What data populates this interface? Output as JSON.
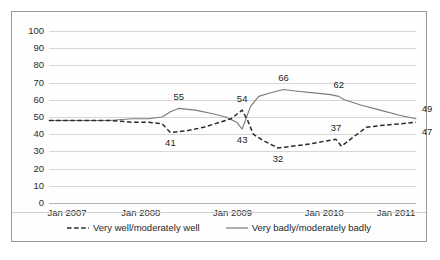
{
  "chart_data": {
    "type": "line",
    "title": "",
    "xlabel": "",
    "ylabel": "",
    "ylim": [
      0,
      100
    ],
    "ytick_step": 10,
    "yticks": [
      100,
      90,
      80,
      70,
      60,
      50,
      40,
      30,
      20,
      10,
      0
    ],
    "xticks": [
      "Jan 2007",
      "Jan 2008",
      "Jan 2009",
      "Jan 2010",
      "Jan 2011"
    ],
    "grid": "horizontal",
    "legend_position": "bottom",
    "series": [
      {
        "name": "Very well/moderately well",
        "style": "dashed",
        "color": "#2b2b2b",
        "points": [
          {
            "x": 0.0,
            "y": 48
          },
          {
            "x": 0.07,
            "y": 48
          },
          {
            "x": 0.14,
            "y": 48
          },
          {
            "x": 0.22,
            "y": 48
          },
          {
            "x": 0.3,
            "y": 47
          },
          {
            "x": 0.36,
            "y": 47
          },
          {
            "x": 0.41,
            "y": 46
          },
          {
            "x": 0.44,
            "y": 41
          },
          {
            "x": 0.5,
            "y": 42
          },
          {
            "x": 0.56,
            "y": 44
          },
          {
            "x": 0.62,
            "y": 47
          },
          {
            "x": 0.66,
            "y": 49
          },
          {
            "x": 0.7,
            "y": 54
          },
          {
            "x": 0.72,
            "y": 48
          },
          {
            "x": 0.74,
            "y": 40
          },
          {
            "x": 0.78,
            "y": 36
          },
          {
            "x": 0.83,
            "y": 32
          },
          {
            "x": 0.88,
            "y": 33
          },
          {
            "x": 0.93,
            "y": 34
          },
          {
            "x": 0.97,
            "y": 35
          },
          {
            "x": 1.0,
            "y": 36
          },
          {
            "x": 1.04,
            "y": 37
          },
          {
            "x": 1.06,
            "y": 33
          },
          {
            "x": 1.1,
            "y": 38
          },
          {
            "x": 1.15,
            "y": 44
          },
          {
            "x": 1.2,
            "y": 45
          },
          {
            "x": 1.27,
            "y": 46
          },
          {
            "x": 1.33,
            "y": 47
          }
        ],
        "labels": [
          {
            "value": 41,
            "at_x": 0.44,
            "position": "below"
          },
          {
            "value": 54,
            "at_x": 0.7,
            "position": "above"
          },
          {
            "value": 32,
            "at_x": 0.83,
            "position": "below"
          },
          {
            "value": 37,
            "at_x": 1.04,
            "position": "above"
          },
          {
            "value": 47,
            "at_x": 1.33,
            "position": "below-right"
          }
        ]
      },
      {
        "name": "Very badly/moderately badly",
        "style": "solid",
        "color": "#7a7a7a",
        "points": [
          {
            "x": 0.0,
            "y": 48
          },
          {
            "x": 0.07,
            "y": 48
          },
          {
            "x": 0.14,
            "y": 48
          },
          {
            "x": 0.22,
            "y": 48
          },
          {
            "x": 0.3,
            "y": 49
          },
          {
            "x": 0.36,
            "y": 49
          },
          {
            "x": 0.41,
            "y": 50
          },
          {
            "x": 0.44,
            "y": 53
          },
          {
            "x": 0.47,
            "y": 55
          },
          {
            "x": 0.53,
            "y": 54
          },
          {
            "x": 0.59,
            "y": 52
          },
          {
            "x": 0.64,
            "y": 50
          },
          {
            "x": 0.68,
            "y": 47
          },
          {
            "x": 0.7,
            "y": 43
          },
          {
            "x": 0.73,
            "y": 56
          },
          {
            "x": 0.76,
            "y": 62
          },
          {
            "x": 0.8,
            "y": 64
          },
          {
            "x": 0.85,
            "y": 66
          },
          {
            "x": 0.9,
            "y": 65
          },
          {
            "x": 0.96,
            "y": 64
          },
          {
            "x": 1.02,
            "y": 63
          },
          {
            "x": 1.05,
            "y": 62
          },
          {
            "x": 1.07,
            "y": 60
          },
          {
            "x": 1.13,
            "y": 57
          },
          {
            "x": 1.2,
            "y": 54
          },
          {
            "x": 1.27,
            "y": 51
          },
          {
            "x": 1.33,
            "y": 49
          }
        ],
        "labels": [
          {
            "value": 55,
            "at_x": 0.47,
            "position": "above"
          },
          {
            "value": 43,
            "at_x": 0.7,
            "position": "below"
          },
          {
            "value": 66,
            "at_x": 0.85,
            "position": "above"
          },
          {
            "value": 62,
            "at_x": 1.05,
            "position": "above"
          },
          {
            "value": 49,
            "at_x": 1.33,
            "position": "above-right"
          }
        ]
      }
    ]
  },
  "legend": {
    "items": [
      {
        "label": "Very well/moderately well",
        "key": "dashed-line-key"
      },
      {
        "label": "Very badly/moderately badly",
        "key": "solid-line-key"
      }
    ]
  },
  "colors": {
    "series_well": "#2b2b2b",
    "series_badly": "#7a7a7a",
    "grid": "#d7d7d7",
    "border": "#9a9a9a",
    "text": "#1f1f1f"
  }
}
